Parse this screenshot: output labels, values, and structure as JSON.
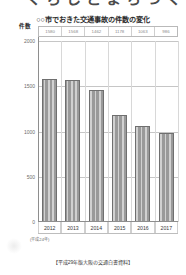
{
  "page": {
    "cut_heading": "くらしとまちづくり",
    "era_note": "(平成24年)",
    "caption": "【平成29年版大阪の交通白書資料】"
  },
  "chart_data": {
    "type": "bar",
    "title": "○○市でおきた交通事故の件数の変化",
    "xlabel": "",
    "ylabel": "件数",
    "ylim": [
      0,
      2000
    ],
    "yticks": [
      2000,
      1500,
      1000,
      500,
      0
    ],
    "grid": true,
    "legend": "none",
    "categories": [
      "2012",
      "2013",
      "2014",
      "2015",
      "2016",
      "2017"
    ],
    "values": [
      1580,
      1568,
      1462,
      1178,
      1063,
      986
    ],
    "data_labels": [
      "1580",
      "1568",
      "1462",
      "1178",
      "1063",
      "986"
    ],
    "bar_color": "#9a9a9a"
  }
}
